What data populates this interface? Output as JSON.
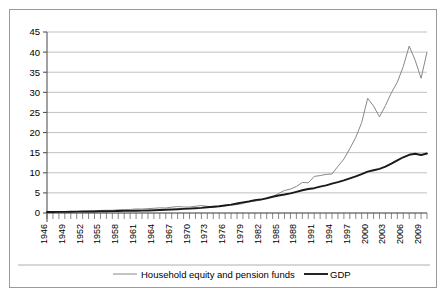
{
  "chart_data": {
    "type": "line",
    "title": "",
    "subtitle": "",
    "xlabel": "",
    "ylabel": "",
    "grid": true,
    "legend_position": "bottom",
    "ylim": [
      0,
      45
    ],
    "yticks": [
      "0",
      "5",
      "10",
      "15",
      "20",
      "25",
      "30",
      "35",
      "40",
      "45"
    ],
    "ytick_values": [
      0,
      5,
      10,
      15,
      20,
      25,
      30,
      35,
      40,
      45
    ],
    "xlim": [
      1946,
      2010
    ],
    "xtick_labels": [
      "1946",
      "1949",
      "1952",
      "1955",
      "1958",
      "1961",
      "1964",
      "1967",
      "1970",
      "1973",
      "1976",
      "1979",
      "1982",
      "1985",
      "1988",
      "1991",
      "1994",
      "1997",
      "2000",
      "2003",
      "2006",
      "2009"
    ],
    "xtick_values": [
      1946,
      1949,
      1952,
      1955,
      1958,
      1961,
      1964,
      1967,
      1970,
      1973,
      1976,
      1979,
      1982,
      1985,
      1988,
      1991,
      1994,
      1997,
      2000,
      2003,
      2006,
      2009
    ],
    "x": [
      1946,
      1947,
      1948,
      1949,
      1950,
      1951,
      1952,
      1953,
      1954,
      1955,
      1956,
      1957,
      1958,
      1959,
      1960,
      1961,
      1962,
      1963,
      1964,
      1965,
      1966,
      1967,
      1968,
      1969,
      1970,
      1971,
      1972,
      1973,
      1974,
      1975,
      1976,
      1977,
      1978,
      1979,
      1980,
      1981,
      1982,
      1983,
      1984,
      1985,
      1986,
      1987,
      1988,
      1989,
      1990,
      1991,
      1992,
      1993,
      1994,
      1995,
      1996,
      1997,
      1998,
      1999,
      2000,
      2001,
      2002,
      2003,
      2004,
      2005,
      2006,
      2007,
      2008,
      2009,
      2010
    ],
    "series": [
      {
        "name": "Household equity and pension funds",
        "color": "#888888",
        "width": 1.0,
        "values": [
          0.22,
          0.24,
          0.26,
          0.28,
          0.33,
          0.37,
          0.4,
          0.45,
          0.55,
          0.62,
          0.68,
          0.66,
          0.8,
          0.86,
          0.88,
          1.0,
          0.98,
          1.08,
          1.18,
          1.28,
          1.25,
          1.45,
          1.6,
          1.5,
          1.48,
          1.68,
          1.85,
          1.65,
          1.4,
          1.7,
          1.95,
          1.95,
          2.1,
          2.35,
          2.85,
          2.9,
          3.3,
          3.85,
          4.05,
          4.85,
          5.6,
          5.95,
          6.6,
          7.6,
          7.5,
          9.1,
          9.3,
          9.6,
          9.7,
          11.6,
          13.4,
          16.0,
          18.8,
          22.5,
          28.5,
          26.6,
          23.9,
          26.7,
          29.9,
          32.5,
          36.4,
          41.5,
          38.0,
          33.5,
          40.0
        ]
      },
      {
        "name": "GDP",
        "color": "#1a1a1a",
        "width": 1.9,
        "values": [
          0.23,
          0.25,
          0.27,
          0.27,
          0.3,
          0.35,
          0.37,
          0.39,
          0.39,
          0.43,
          0.45,
          0.47,
          0.48,
          0.52,
          0.54,
          0.56,
          0.6,
          0.64,
          0.69,
          0.74,
          0.81,
          0.86,
          0.94,
          1.02,
          1.08,
          1.17,
          1.28,
          1.43,
          1.55,
          1.69,
          1.88,
          2.09,
          2.36,
          2.63,
          2.86,
          3.21,
          3.34,
          3.63,
          4.04,
          4.35,
          4.59,
          4.87,
          5.25,
          5.66,
          5.98,
          6.17,
          6.54,
          6.88,
          7.31,
          7.66,
          8.1,
          8.61,
          9.09,
          9.66,
          10.29,
          10.62,
          10.98,
          11.51,
          12.27,
          13.09,
          13.86,
          14.48,
          14.72,
          14.42,
          14.8
        ]
      }
    ],
    "legend": [
      {
        "label": "Household equity and pension funds",
        "color": "#888888",
        "style": "thin-line"
      },
      {
        "label": "GDP",
        "color": "#1a1a1a",
        "style": "thick-line"
      }
    ]
  },
  "colors": {
    "equity_series": "#888888",
    "gdp_series": "#1a1a1a",
    "gridline": "#a6a6a6",
    "axis": "#555555",
    "frame_border": "#9a9a9a",
    "background": "#ffffff"
  }
}
